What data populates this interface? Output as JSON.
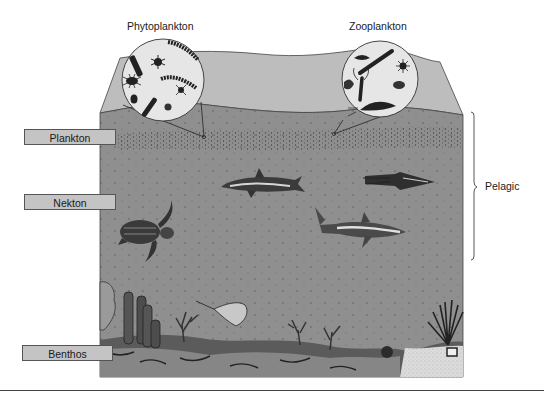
{
  "diagram": {
    "titles": {
      "phytoplankton": "Phytoplankton",
      "zooplankton": "Zooplankton"
    },
    "zone_labels": {
      "plankton": "Plankton",
      "nekton": "Nekton",
      "benthos": "Benthos"
    },
    "bracket_label": "Pelagic",
    "organisms": {
      "phytoplankton_inset": [
        "diatom-chain",
        "dinoflagellate",
        "rod-diatom",
        "centric-diatom",
        "spiny-cell"
      ],
      "zooplankton_inset": [
        "copepod",
        "larval-shrimp",
        "krill",
        "jellyfish-larva",
        "crab-larva"
      ],
      "nekton": [
        "dolphin",
        "squid",
        "sea-turtle",
        "shark"
      ],
      "benthos": [
        "tube-sponges",
        "stingray",
        "corals",
        "sea-fan",
        "sea-urchin",
        "rocks",
        "sand"
      ]
    },
    "colors": {
      "water": "#8f8f8f",
      "surface": "#bdbdbd",
      "label_fill": "#c4c4c4",
      "inset_fill": "#e6e6e6",
      "sand": "#d9d9d9"
    }
  }
}
